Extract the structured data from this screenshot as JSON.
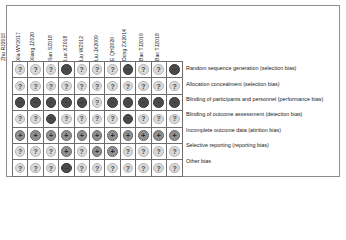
{
  "figure": {
    "type": "risk-of-bias-summary",
    "studies": [
      "Zhu RJ2015",
      "Xia WY2017",
      "Xiang JZ020",
      "Sun SZ018",
      "Luo XZ018",
      "Liu WZ012",
      "Liu JX2009",
      "E QH2020",
      "Dong ZX2014",
      "Bao TJ2019",
      "Bao TJ2018"
    ],
    "domains": [
      "Random sequence generation (selection bias)",
      "Allocation concealment (selection bias)",
      "Blinding of participants and personnel (performance bias)",
      "Blinding of outcome assessment (detection bias)",
      "Incomplete outcome data (attrition bias)",
      "Selective reporting (reporting bias)",
      "Other bias"
    ],
    "legend": {
      "unclear": {
        "glyph": "?",
        "meaning": "Unclear risk of bias",
        "color": "#d9d9d9"
      },
      "low": {
        "glyph": "+",
        "meaning": "Low risk of bias",
        "color": "#8f8f8f"
      },
      "high": {
        "glyph": "−",
        "meaning": "High risk of bias",
        "color": "#4a4a4a"
      }
    },
    "judgements": [
      [
        "unclear",
        "unclear",
        "unclear",
        "high",
        "unclear",
        "unclear",
        "unclear",
        "high",
        "unclear",
        "unclear",
        "high"
      ],
      [
        "unclear",
        "unclear",
        "unclear",
        "unclear",
        "unclear",
        "unclear",
        "unclear",
        "unclear",
        "unclear",
        "unclear",
        "unclear"
      ],
      [
        "high",
        "high",
        "high",
        "high",
        "high",
        "unclear",
        "high",
        "high",
        "high",
        "high",
        "high"
      ],
      [
        "unclear",
        "unclear",
        "high",
        "unclear",
        "unclear",
        "unclear",
        "unclear",
        "high",
        "unclear",
        "unclear",
        "unclear"
      ],
      [
        "low",
        "low",
        "low",
        "low",
        "low",
        "low",
        "low",
        "low",
        "low",
        "low",
        "low"
      ],
      [
        "unclear",
        "unclear",
        "unclear",
        "low",
        "unclear",
        "low",
        "low",
        "unclear",
        "unclear",
        "unclear",
        "unclear"
      ],
      [
        "unclear",
        "unclear",
        "unclear",
        "high",
        "unclear",
        "unclear",
        "unclear",
        "unclear",
        "unclear",
        "unclear",
        "unclear"
      ]
    ]
  }
}
